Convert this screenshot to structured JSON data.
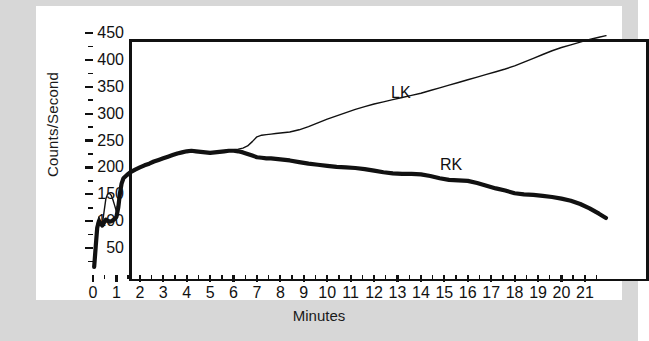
{
  "chart_data": {
    "type": "line",
    "title": "",
    "subtitle": "",
    "xlabel": "Minutes",
    "ylabel": "Counts/Second",
    "xlim": [
      0,
      22.2
    ],
    "ylim": [
      0,
      450
    ],
    "grid": false,
    "legend_position": "inline-annotation",
    "xticks": [
      0,
      1,
      2,
      3,
      4,
      5,
      6,
      7,
      8,
      9,
      10,
      11,
      12,
      13,
      14,
      15,
      16,
      17,
      18,
      19,
      20,
      21
    ],
    "xtick_labels": [
      "0",
      "1",
      "2",
      "3",
      "4",
      "5",
      "6",
      "7",
      "8",
      "9",
      "10",
      "11",
      "12",
      "13",
      "14",
      "15",
      "16",
      "17",
      "18",
      "19",
      "20",
      "21"
    ],
    "yticks": [
      50,
      100,
      150,
      200,
      250,
      300,
      350,
      400,
      450
    ],
    "ytick_labels": [
      "50",
      "100",
      "150",
      "200",
      "250",
      "300",
      "350",
      "400",
      "450"
    ],
    "annotations": [
      {
        "text": "LK",
        "x": 11.2,
        "y": 330
      },
      {
        "text": "RK",
        "x": 13.4,
        "y": 205
      }
    ],
    "series": [
      {
        "name": "LK",
        "label": "LK",
        "color": "#111111",
        "line_width": 1.4,
        "x": [
          0.05,
          0.12,
          0.18,
          0.25,
          0.32,
          0.4,
          0.48,
          0.55,
          0.62,
          0.7,
          0.78,
          0.85,
          0.92,
          1.0,
          1.08,
          1.15,
          1.22,
          1.3,
          1.45,
          1.6,
          1.8,
          2.0,
          2.2,
          2.4,
          2.6,
          2.8,
          3.0,
          3.2,
          3.4,
          3.6,
          3.8,
          4.0,
          4.2,
          4.4,
          4.6,
          4.8,
          5.0,
          5.2,
          5.4,
          5.6,
          5.8,
          6.0,
          6.2,
          6.4,
          6.6,
          6.8,
          7.0,
          7.2,
          7.4,
          7.6,
          7.8,
          8.0,
          8.4,
          8.8,
          9.2,
          9.6,
          10.0,
          10.4,
          10.8,
          11.2,
          11.6,
          12.0,
          12.4,
          12.8,
          13.2,
          13.6,
          14.0,
          14.4,
          14.8,
          15.2,
          15.6,
          16.0,
          16.4,
          16.8,
          17.2,
          17.6,
          18.0,
          18.4,
          18.8,
          19.2,
          19.6,
          20.0,
          20.4,
          20.8,
          21.2,
          21.6,
          21.9
        ],
        "y": [
          18,
          60,
          95,
          108,
          100,
          95,
          120,
          142,
          150,
          152,
          148,
          140,
          130,
          118,
          128,
          155,
          172,
          182,
          188,
          193,
          197,
          201,
          205,
          208,
          212,
          215,
          218,
          221,
          224,
          227,
          229,
          231,
          232,
          231,
          230,
          229,
          228,
          229,
          230,
          231,
          232,
          233,
          234,
          236,
          240,
          248,
          257,
          260,
          261,
          262,
          263,
          264,
          266,
          270,
          276,
          283,
          290,
          296,
          302,
          308,
          313,
          318,
          322,
          326,
          330,
          334,
          338,
          343,
          348,
          353,
          358,
          363,
          368,
          373,
          378,
          383,
          389,
          396,
          403,
          410,
          417,
          423,
          428,
          433,
          438,
          442,
          445
        ]
      },
      {
        "name": "RK",
        "label": "RK",
        "color": "#111111",
        "line_width": 4.2,
        "x": [
          0.05,
          0.12,
          0.18,
          0.25,
          0.32,
          0.4,
          0.48,
          0.55,
          0.62,
          0.7,
          0.78,
          0.85,
          0.92,
          1.0,
          1.08,
          1.15,
          1.22,
          1.3,
          1.45,
          1.6,
          1.8,
          2.0,
          2.2,
          2.4,
          2.6,
          2.8,
          3.0,
          3.2,
          3.4,
          3.6,
          3.8,
          4.0,
          4.2,
          4.4,
          4.6,
          4.8,
          5.0,
          5.2,
          5.4,
          5.6,
          5.8,
          6.0,
          6.2,
          6.4,
          6.6,
          6.8,
          7.0,
          7.2,
          7.4,
          7.6,
          7.8,
          8.0,
          8.4,
          8.8,
          9.2,
          9.6,
          10.0,
          10.4,
          10.8,
          11.2,
          11.6,
          12.0,
          12.4,
          12.8,
          13.2,
          13.6,
          14.0,
          14.4,
          14.8,
          15.2,
          15.6,
          16.0,
          16.4,
          16.8,
          17.2,
          17.6,
          18.0,
          18.4,
          18.8,
          19.2,
          19.6,
          20.0,
          20.4,
          20.8,
          21.2,
          21.6,
          21.9
        ],
        "y": [
          15,
          55,
          88,
          100,
          96,
          92,
          98,
          103,
          101,
          99,
          100,
          102,
          104,
          108,
          126,
          152,
          170,
          180,
          186,
          191,
          196,
          200,
          204,
          207,
          211,
          214,
          217,
          220,
          223,
          226,
          228,
          230,
          231,
          230,
          229,
          228,
          227,
          228,
          229,
          230,
          231,
          231,
          230,
          228,
          225,
          222,
          219,
          218,
          217,
          217,
          216,
          215,
          213,
          210,
          207,
          205,
          203,
          201,
          200,
          199,
          197,
          194,
          191,
          189,
          188,
          188,
          187,
          184,
          180,
          177,
          176,
          175,
          171,
          166,
          161,
          157,
          152,
          150,
          149,
          147,
          145,
          142,
          138,
          132,
          124,
          114,
          106
        ]
      }
    ]
  },
  "axis": {
    "ylabel": "Counts/Second",
    "xlabel": "Minutes"
  }
}
